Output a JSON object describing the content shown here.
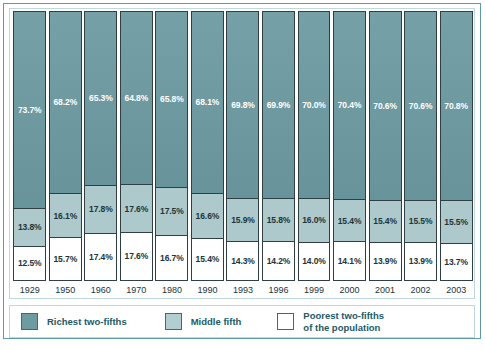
{
  "chart_data": {
    "type": "bar",
    "title": "",
    "subtitle": "",
    "xlabel": "",
    "ylabel": "",
    "ylim": [
      0,
      100
    ],
    "grid": false,
    "stacked": true,
    "stacked_percent": true,
    "legend_position": "bottom",
    "categories": [
      "1929",
      "1950",
      "1960",
      "1970",
      "1980",
      "1990",
      "1993",
      "1996",
      "1999",
      "2000",
      "2001",
      "2002",
      "2003"
    ],
    "series": [
      {
        "name": "Richest two-fifths",
        "color": "#6d9ba2",
        "values": [
          73.7,
          68.2,
          65.3,
          64.8,
          65.8,
          68.1,
          69.8,
          69.9,
          70.0,
          70.4,
          70.6,
          70.6,
          70.8
        ],
        "labels": [
          "73.7%",
          "68.2%",
          "65.3%",
          "64.8%",
          "65.8%",
          "68.1%",
          "69.8%",
          "69.9%",
          "70.0%",
          "70.4%",
          "70.6%",
          "70.6%",
          "70.8%"
        ]
      },
      {
        "name": "Middle fifth",
        "color": "#aec9cb",
        "values": [
          13.8,
          16.1,
          17.8,
          17.6,
          17.5,
          16.6,
          15.9,
          15.8,
          16.0,
          15.4,
          15.4,
          15.5,
          15.5
        ],
        "labels": [
          "13.8%",
          "16.1%",
          "17.8%",
          "17.6%",
          "17.5%",
          "16.6%",
          "15.9%",
          "15.8%",
          "16.0%",
          "15.4%",
          "15.4%",
          "15.5%",
          "15.5%"
        ]
      },
      {
        "name": "Poorest two-fifths of the population",
        "color": "#ffffff",
        "values": [
          12.5,
          15.7,
          17.4,
          17.6,
          16.7,
          15.4,
          14.3,
          14.2,
          14.0,
          14.1,
          13.9,
          13.9,
          13.7
        ],
        "labels": [
          "12.5%",
          "15.7%",
          "17.4%",
          "17.6%",
          "16.7%",
          "15.4%",
          "14.3%",
          "14.2%",
          "14.0%",
          "14.1%",
          "13.9%",
          "13.9%",
          "13.7%"
        ]
      }
    ]
  },
  "legend": {
    "items": [
      {
        "label_line1": "Richest two-fifths",
        "label_line2": "",
        "swatch": "rich"
      },
      {
        "label_line1": "Middle fifth",
        "label_line2": "",
        "swatch": "mid"
      },
      {
        "label_line1": "Poorest two-fifths",
        "label_line2": "of the population",
        "swatch": "poor"
      }
    ]
  },
  "colors": {
    "richest": "#6d9ba2",
    "middle": "#aec9cb",
    "poorest": "#ffffff",
    "frame": "#5f9aa8",
    "inner_frame": "#bfd9de",
    "bar_outline": "#2f3f44",
    "legend_text": "#1d5a66",
    "axis_text": "#20343a"
  }
}
